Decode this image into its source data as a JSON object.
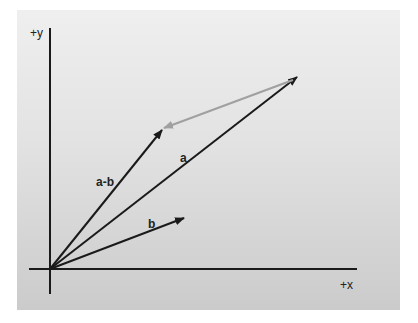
{
  "diagram": {
    "axes": {
      "x_label": "+x",
      "y_label": "+y"
    },
    "vectors": [
      {
        "name": "a",
        "label": "a",
        "from": "origin",
        "color": "#1a1a1a"
      },
      {
        "name": "b",
        "label": "b",
        "from": "origin",
        "color": "#1a1a1a"
      },
      {
        "name": "a-b",
        "label": "a-b",
        "from": "origin",
        "color": "#1a1a1a"
      },
      {
        "name": "minus-b",
        "label": "",
        "from": "tip-of-a",
        "to": "tip-of-a-b",
        "color": "#a0a0a0"
      }
    ],
    "colors": {
      "background_top": "#efefef",
      "background_bottom": "#cbcbcb",
      "vector": "#1a1a1a",
      "difference_arrow": "#a0a0a0"
    }
  }
}
